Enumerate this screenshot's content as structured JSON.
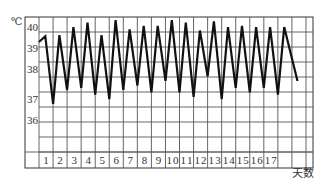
{
  "chart_data": {
    "type": "line",
    "title": "",
    "ylabel": "℃",
    "xlabel": "天数",
    "ylim": [
      35.5,
      40.5
    ],
    "yticks": [
      "40",
      "39",
      "38",
      "37",
      "36"
    ],
    "ytick_values": [
      40,
      39,
      38,
      37,
      36
    ],
    "x_categories": [
      "1",
      "2",
      "3",
      "4",
      "5",
      "6",
      "7",
      "8",
      "9",
      "10",
      "11",
      "12",
      "13",
      "14",
      "15",
      "16",
      "17"
    ],
    "grid": true,
    "legend": "none",
    "series": [
      {
        "name": "体温",
        "points": [
          [
            0.0,
            39.5
          ],
          [
            0.45,
            39.75
          ],
          [
            1.0,
            36.8
          ],
          [
            1.45,
            39.8
          ],
          [
            2.0,
            37.4
          ],
          [
            2.45,
            40.15
          ],
          [
            3.0,
            37.5
          ],
          [
            3.45,
            40.35
          ],
          [
            4.0,
            37.2
          ],
          [
            4.45,
            39.8
          ],
          [
            5.0,
            37.0
          ],
          [
            5.45,
            40.45
          ],
          [
            6.0,
            37.4
          ],
          [
            6.45,
            40.05
          ],
          [
            7.0,
            37.6
          ],
          [
            7.45,
            40.2
          ],
          [
            8.0,
            37.3
          ],
          [
            8.45,
            40.2
          ],
          [
            9.0,
            37.8
          ],
          [
            9.45,
            40.45
          ],
          [
            10.0,
            37.3
          ],
          [
            10.45,
            40.35
          ],
          [
            11.0,
            37.1
          ],
          [
            11.45,
            40.0
          ],
          [
            12.0,
            38.0
          ],
          [
            12.45,
            40.4
          ],
          [
            13.0,
            37.0
          ],
          [
            13.45,
            40.15
          ],
          [
            14.0,
            37.5
          ],
          [
            14.45,
            40.2
          ],
          [
            15.0,
            37.3
          ],
          [
            15.45,
            40.15
          ],
          [
            16.0,
            37.5
          ],
          [
            16.45,
            40.15
          ],
          [
            17.0,
            37.2
          ],
          [
            17.45,
            40.15
          ],
          [
            18.4,
            37.8
          ]
        ]
      }
    ]
  }
}
